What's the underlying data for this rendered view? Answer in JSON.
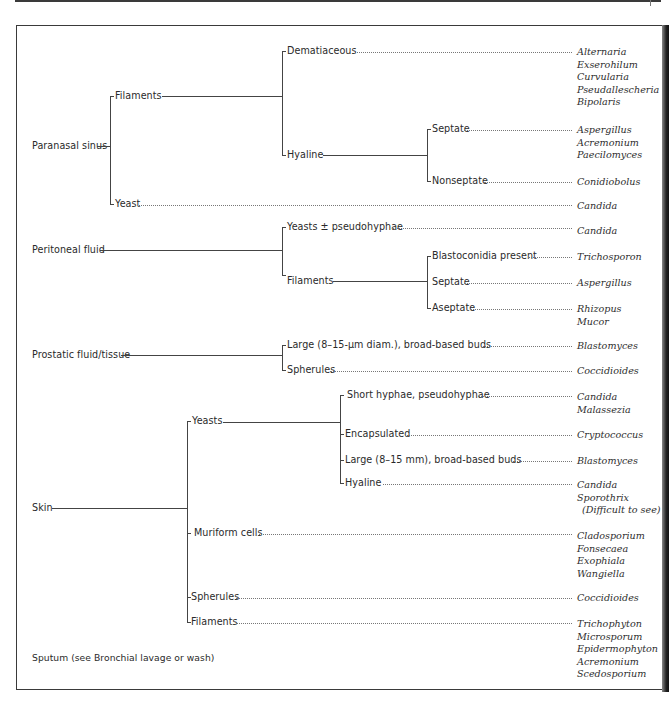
{
  "figure": {
    "type": "fungal-identification-tree-by-specimen-source",
    "specimens": [
      {
        "name": "Paranasal sinus",
        "branches": [
          {
            "name": "Filaments",
            "branches": [
              {
                "name": "Dematiaceous",
                "organisms": [
                  "Alternaria",
                  "Exserohilum",
                  "Curvularia",
                  "Pseudallescheria",
                  "Bipolaris"
                ]
              },
              {
                "name": "Hyaline",
                "branches": [
                  {
                    "name": "Septate",
                    "organisms": [
                      "Aspergillus",
                      "Acremonium",
                      "Paecilomyces"
                    ]
                  },
                  {
                    "name": "Nonseptate",
                    "organisms": [
                      "Conidiobolus"
                    ]
                  }
                ]
              }
            ]
          },
          {
            "name": "Yeast",
            "organisms": [
              "Candida"
            ]
          }
        ]
      },
      {
        "name": "Peritoneal fluid",
        "branches": [
          {
            "name": "Yeasts ± pseudohyphae",
            "organisms": [
              "Candida"
            ]
          },
          {
            "name": "Filaments",
            "branches": [
              {
                "name": "Blastoconidia present",
                "organisms": [
                  "Trichosporon"
                ]
              },
              {
                "name": "Septate",
                "organisms": [
                  "Aspergillus"
                ]
              },
              {
                "name": "Aseptate",
                "organisms": [
                  "Rhizopus",
                  "Mucor"
                ]
              }
            ]
          }
        ]
      },
      {
        "name": "Prostatic fluid/tissue",
        "branches": [
          {
            "name": "Large (8–15-μm diam.), broad-based buds",
            "organisms": [
              "Blastomyces"
            ]
          },
          {
            "name": "Spherules",
            "organisms": [
              "Coccidioides"
            ]
          }
        ]
      },
      {
        "name": "Skin",
        "branches": [
          {
            "name": "Yeasts",
            "branches": [
              {
                "name": "Short hyphae, pseudohyphae",
                "organisms": [
                  "Candida",
                  "Malassezia"
                ]
              },
              {
                "name": "Encapsulated",
                "organisms": [
                  "Cryptococcus"
                ]
              },
              {
                "name": "Large (8–15 mm), broad-based buds",
                "organisms": [
                  "Blastomyces"
                ]
              },
              {
                "name": "Hyaline",
                "organisms": [
                  "Candida",
                  "Sporothrix",
                  "(Difficult to see)"
                ]
              }
            ]
          },
          {
            "name": "Muriform cells",
            "organisms": [
              "Cladosporium",
              "Fonsecaea",
              "Exophiala",
              "Wangiella"
            ]
          },
          {
            "name": "Spherules",
            "organisms": [
              "Coccidioides"
            ]
          },
          {
            "name": "Filaments",
            "organisms": [
              "Trichophyton",
              "Microsporum",
              "Epidermophyton",
              "Acremonium",
              "Scedosporium"
            ]
          }
        ]
      },
      {
        "name": "Sputum (see Bronchial lavage or wash)",
        "branches": []
      }
    ]
  },
  "labels": {
    "ps": "Paranasal sinus",
    "ps_fil": "Filaments",
    "ps_dem": "Dematiaceous",
    "ps_hya": "Hyaline",
    "ps_sep": "Septate",
    "ps_nonsep": "Nonseptate",
    "ps_yeast": "Yeast",
    "pf": "Peritoneal fluid",
    "pf_yeasts": "Yeasts ± pseudohyphae",
    "pf_fil": "Filaments",
    "pf_blasto": "Blastoconidia present",
    "pf_sep": "Septate",
    "pf_asep": "Aseptate",
    "pr": "Prostatic fluid/tissue",
    "pr_large": "Large (8–15-μm diam.), broad-based buds",
    "pr_sph": "Spherules",
    "sk": "Skin",
    "sk_yeasts": "Yeasts",
    "sk_short": "Short hyphae, pseudohyphae",
    "sk_encap": "Encapsulated",
    "sk_large": "Large (8–15 mm), broad-based buds",
    "sk_hya": "Hyaline",
    "sk_muri": "Muriform cells",
    "sk_sph": "Spherules",
    "sk_fil": "Filaments",
    "sputum": "Sputum (see Bronchial lavage or wash)"
  },
  "organisms": {
    "ps_dem": [
      "Alternaria",
      "Exserohilum",
      "Curvularia",
      "Pseudallescheria",
      "Bipolaris"
    ],
    "ps_sep": [
      "Aspergillus",
      "Acremonium",
      "Paecilomyces"
    ],
    "ps_nonsep": [
      "Conidiobolus"
    ],
    "ps_yeast": [
      "Candida"
    ],
    "pf_yeasts": [
      "Candida"
    ],
    "pf_blasto": [
      "Trichosporon"
    ],
    "pf_sep": [
      "Aspergillus"
    ],
    "pf_asep": [
      "Rhizopus",
      "Mucor"
    ],
    "pr_large": [
      "Blastomyces"
    ],
    "pr_sph": [
      "Coccidioides"
    ],
    "sk_short": [
      "Candida",
      "Malassezia"
    ],
    "sk_encap": [
      "Cryptococcus"
    ],
    "sk_large": [
      "Blastomyces"
    ],
    "sk_hya": [
      "Candida",
      "Sporothrix",
      "(Difficult to see)"
    ],
    "sk_muri": [
      "Cladosporium",
      "Fonsecaea",
      "Exophiala",
      "Wangiella"
    ],
    "sk_sph": [
      "Coccidioides"
    ],
    "sk_fil": [
      "Trichophyton",
      "Microsporum",
      "Epidermophyton",
      "Acremonium",
      "Scedosporium"
    ]
  },
  "colors": {
    "line": "#444444",
    "text": "#2a2a2a",
    "frame": "#3a3a3a"
  }
}
